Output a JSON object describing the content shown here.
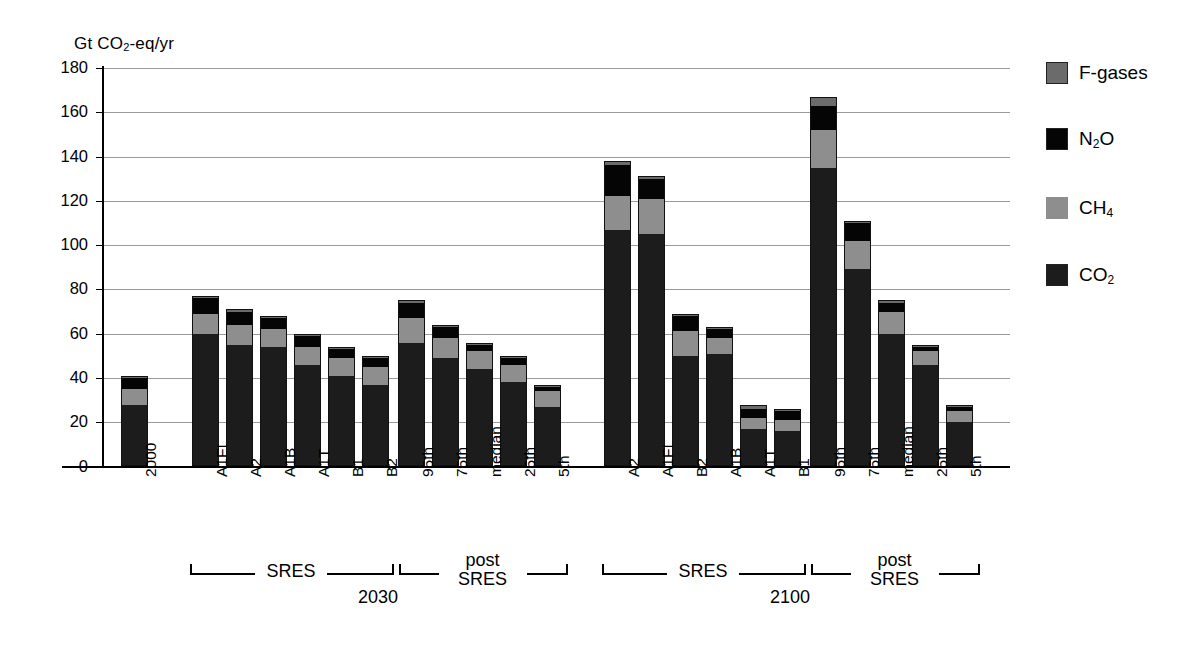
{
  "axis": {
    "unit_label": "Gt CO2-eq/yr",
    "unit_label_main": "Gt CO",
    "unit_label_sub": "2",
    "unit_label_tail": "-eq/yr",
    "yticks": [
      "0",
      "20",
      "40",
      "60",
      "80",
      "100",
      "120",
      "140",
      "160",
      "180"
    ]
  },
  "legend": {
    "items": [
      {
        "label": "F-gases",
        "key": "fgas",
        "color": "#6b6b6b"
      },
      {
        "label": "N2O",
        "key": "n2o",
        "color": "#050505",
        "main": "N",
        "sub": "2",
        "tail": "O"
      },
      {
        "label": "CH4",
        "key": "ch4",
        "color": "#8e8e8e",
        "main": "CH",
        "sub": "4",
        "tail": ""
      },
      {
        "label": "CO2",
        "key": "co2",
        "color": "#1c1c1c",
        "main": "CO",
        "sub": "2",
        "tail": ""
      }
    ]
  },
  "groups": [
    {
      "name": "sres-2030",
      "label": "SRES",
      "year": "2030"
    },
    {
      "name": "post-sres-2030",
      "label": "post SRES",
      "label_line1": "post",
      "label_line2": "SRES"
    },
    {
      "name": "sres-2100",
      "label": "SRES",
      "year": "2100"
    },
    {
      "name": "post-sres-2100",
      "label": "post SRES",
      "label_line1": "post",
      "label_line2": "SRES"
    }
  ],
  "chart_data": {
    "type": "bar",
    "subtype": "stacked",
    "title": "",
    "xlabel": "",
    "ylabel": "Gt CO2-eq/yr",
    "ylim": [
      0,
      180
    ],
    "ytick_step": 20,
    "grid": true,
    "legend_position": "right",
    "series": [
      {
        "name": "CO2",
        "key": "co2",
        "color": "#1c1c1c",
        "values": [
          28,
          60,
          55,
          54,
          46,
          41,
          37,
          56,
          49,
          44,
          38,
          27,
          107,
          105,
          50,
          51,
          17,
          16,
          135,
          89,
          60,
          46,
          20
        ]
      },
      {
        "name": "CH4",
        "key": "ch4",
        "color": "#8e8e8e",
        "values": [
          7,
          9,
          9,
          8,
          8,
          8,
          8,
          11,
          9,
          8,
          8,
          7,
          15,
          16,
          11,
          7,
          5,
          5,
          17,
          13,
          10,
          6,
          5
        ]
      },
      {
        "name": "N2O",
        "key": "n2o",
        "color": "#050505",
        "values": [
          5,
          7,
          6,
          5,
          5,
          4,
          4,
          7,
          5,
          3,
          3,
          2,
          14,
          9,
          7,
          4,
          4,
          4,
          11,
          8,
          4,
          2,
          2
        ]
      },
      {
        "name": "F-gases",
        "key": "fgas",
        "color": "#6b6b6b",
        "values": [
          1,
          1,
          1,
          1,
          1,
          1,
          1,
          1,
          1,
          1,
          1,
          1,
          2,
          1,
          1,
          1,
          2,
          1,
          4,
          1,
          1,
          1,
          1
        ]
      }
    ],
    "categories": [
      "2000",
      "A1FI",
      "A2",
      "A1B",
      "A1T",
      "B1",
      "B2",
      "95th",
      "75th",
      "median",
      "25th",
      "5th",
      "A2",
      "A1FI",
      "B2",
      "A1B",
      "A1T",
      "B1",
      "95th",
      "75th",
      "median",
      "25th",
      "5th"
    ],
    "totals": [
      41,
      77,
      71,
      68,
      60,
      54,
      50,
      75,
      64,
      56,
      50,
      37,
      138,
      131,
      69,
      63,
      28,
      26,
      167,
      111,
      75,
      55,
      28
    ]
  }
}
